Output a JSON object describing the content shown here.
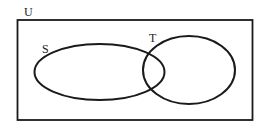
{
  "diagram": {
    "type": "venn",
    "universe": {
      "label": "U",
      "x": 17,
      "y": 20,
      "width": 236,
      "height": 100
    },
    "sets": [
      {
        "label": "S",
        "cx": 99.5,
        "cy": 72,
        "rx": 65,
        "ry": 28,
        "label_x": 42,
        "label_y": 53
      },
      {
        "label": "T",
        "cx": 189,
        "cy": 70,
        "rx": 46,
        "ry": 34,
        "label_x": 149,
        "label_y": 42
      }
    ],
    "stroke_color": "#1a1a1a",
    "background": "#ffffff"
  }
}
